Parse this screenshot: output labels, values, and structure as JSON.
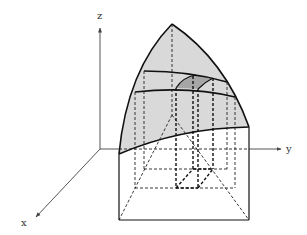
{
  "diagram": {
    "type": "3d-volume-under-surface",
    "axes": {
      "x_label": "x",
      "y_label": "y",
      "z_label": "z"
    },
    "colors": {
      "surface_fill": "#d9d9d9",
      "patch_fill": "#a6a6a6",
      "line": "#111111",
      "axis": "#555555"
    },
    "elements": [
      {
        "name": "curved-surface",
        "description": "shaded curved top surface with apex"
      },
      {
        "name": "upper-cross-section-curve",
        "description": "solid curve across surface"
      },
      {
        "name": "lower-cross-section-curve",
        "description": "solid curve across surface"
      },
      {
        "name": "surface-patch",
        "description": "darker shaded small patch on surface"
      },
      {
        "name": "base-rectangle",
        "description": "rectangular region in xy-plane"
      },
      {
        "name": "small-box-column",
        "description": "dashed column from floor cell to patch"
      }
    ]
  }
}
